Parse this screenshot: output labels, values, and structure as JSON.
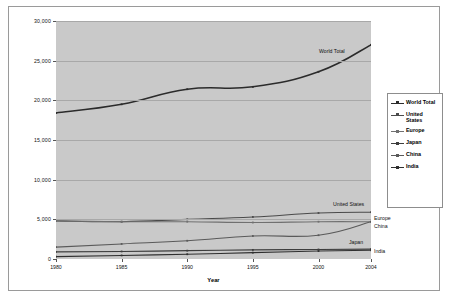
{
  "chart_data": {
    "type": "line",
    "title": "",
    "xlabel": "Year",
    "ylabel": "Million Metric Tons of Carbon Dioxide",
    "x": [
      1980,
      1985,
      1990,
      1995,
      2000,
      2004
    ],
    "xtick_labels": [
      "1980",
      "1985",
      "1990",
      "1995",
      "2000",
      "2004"
    ],
    "ytick_labels": [
      "0",
      "5,000",
      "10,000",
      "15,000",
      "20,000",
      "25,000",
      "30,000"
    ],
    "ylim": [
      0,
      30000
    ],
    "ytick_step": 5000,
    "xlim": [
      1980,
      2004
    ],
    "grid": "horizontal",
    "legend_position": "right",
    "plot_background": "#c9c9c9",
    "series": [
      {
        "name": "World Total",
        "color": "#2b2b2b",
        "values": [
          18400,
          19500,
          21400,
          21700,
          23600,
          27000
        ],
        "inline_label": "World Total"
      },
      {
        "name": "United States",
        "color": "#4a4a4a",
        "values": [
          4800,
          4700,
          5000,
          5300,
          5800,
          5900
        ],
        "inline_label": "United States"
      },
      {
        "name": "Europe",
        "color": "#707070",
        "values": [
          4800,
          4700,
          4700,
          4600,
          4700,
          4700
        ],
        "inline_label": "Europe"
      },
      {
        "name": "Japan",
        "color": "#3d3d3d",
        "values": [
          900,
          950,
          1050,
          1150,
          1200,
          1250
        ],
        "inline_label": "Japan"
      },
      {
        "name": "China",
        "color": "#5a5a5a",
        "values": [
          1500,
          1900,
          2300,
          2900,
          3000,
          4700
        ],
        "inline_label": "China"
      },
      {
        "name": "India",
        "color": "#2f2f2f",
        "values": [
          300,
          450,
          600,
          800,
          1000,
          1100
        ],
        "inline_label": "India"
      }
    ]
  },
  "legend": {
    "items": [
      {
        "label": "World Total"
      },
      {
        "label": "United States"
      },
      {
        "label": "Europe"
      },
      {
        "label": "Japan"
      },
      {
        "label": "China"
      },
      {
        "label": "India"
      }
    ]
  }
}
